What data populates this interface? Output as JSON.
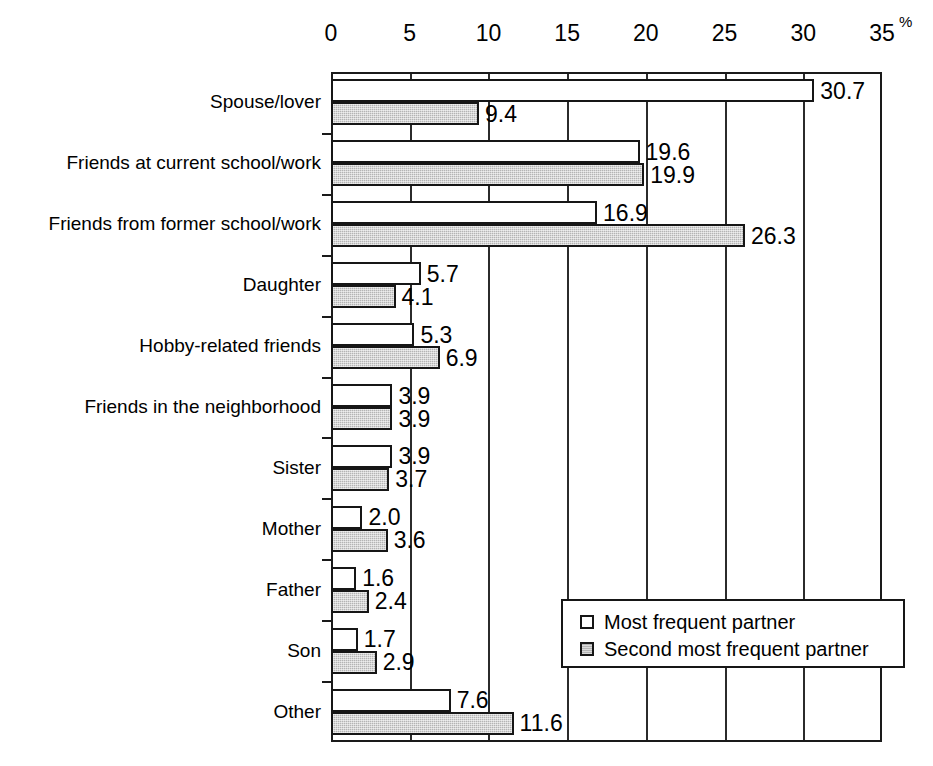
{
  "chart_data": {
    "type": "bar",
    "orientation": "horizontal",
    "title": "",
    "subtitle": "",
    "xlabel": "",
    "ylabel": "",
    "unit_symbol": "%",
    "xlim": [
      0,
      35
    ],
    "xticks": [
      0,
      5,
      10,
      15,
      20,
      25,
      30,
      35
    ],
    "xtick_labels": [
      "0",
      "5",
      "10",
      "15",
      "20",
      "25",
      "30",
      "35"
    ],
    "grid": "vertical",
    "axis_position": "top",
    "legend_position": "bottom-right",
    "categories": [
      "Spouse/lover",
      "Friends at current school/work",
      "Friends from former school/work",
      "Daughter",
      "Hobby-related friends",
      "Friends in the neighborhood",
      "Sister",
      "Mother",
      "Father",
      "Son",
      "Other"
    ],
    "series": [
      {
        "name": "Most frequent partner",
        "fill": "white",
        "values": [
          30.7,
          19.6,
          16.9,
          5.7,
          5.3,
          3.9,
          3.9,
          2.0,
          1.6,
          1.7,
          7.6
        ],
        "value_labels": [
          "30.7",
          "19.6",
          "16.9",
          "5.7",
          "5.3",
          "3.9",
          "3.9",
          "2.0",
          "1.6",
          "1.7",
          "7.6"
        ]
      },
      {
        "name": "Second most frequent partner",
        "fill": "gray",
        "values": [
          9.4,
          19.9,
          26.3,
          4.1,
          6.9,
          3.9,
          3.7,
          3.6,
          2.4,
          2.9,
          11.6
        ],
        "value_labels": [
          "9.4",
          "19.9",
          "26.3",
          "4.1",
          "6.9",
          "3.9",
          "3.7",
          "3.6",
          "2.4",
          "2.9",
          "11.6"
        ]
      }
    ]
  },
  "legend": {
    "entries": [
      {
        "label": "Most frequent partner",
        "swatch": "white"
      },
      {
        "label": "Second most frequent partner",
        "swatch": "gray"
      }
    ]
  },
  "colors": {
    "bar_outline": "#161616",
    "bar_white_fill": "#ffffff",
    "bar_gray_fill": "#b4b4b4",
    "axis_line": "#1a1a1a",
    "gridline": "#2b2b2b",
    "text": "#000000",
    "background": "#ffffff"
  }
}
